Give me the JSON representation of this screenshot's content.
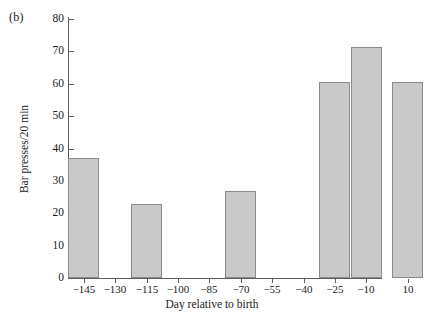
{
  "figure": {
    "panel_label": "(b)",
    "background": "#ffffff",
    "bar_fill": "#c9c9c9",
    "bar_edge": "#8a8a8a",
    "axis_color": "#5c5c5c"
  },
  "chart_data": {
    "type": "bar",
    "title": "",
    "xlabel": "Day relative to birth",
    "ylabel": "Bar presses/20 min",
    "categories": [
      "-145",
      "-115",
      "-70",
      "-25",
      "-10",
      "10"
    ],
    "values": [
      37,
      23,
      27,
      60.5,
      71.5,
      60.5
    ],
    "x": [
      -145,
      -115,
      -70,
      -25,
      -10,
      10
    ],
    "bar_width_days": 15,
    "xlim": [
      -152.5,
      -2.5
    ],
    "ylim": [
      0,
      80
    ],
    "ytick_values": [
      0,
      10,
      20,
      30,
      40,
      50,
      60,
      70,
      80
    ],
    "ytick_labels": [
      "0",
      "10",
      "20",
      "30",
      "40",
      "50",
      "60",
      "70",
      "80"
    ],
    "xtick_values": [
      -145,
      -130,
      -115,
      -100,
      -85,
      -70,
      -55,
      -40,
      -25,
      -10,
      10
    ],
    "xtick_labels": [
      "−145",
      "−130",
      "−115",
      "−100",
      "−85",
      "−70",
      "−55",
      "−40",
      "−25",
      "−10",
      "10"
    ],
    "grid": false,
    "legend": null,
    "series": [
      {
        "name": "Bar presses per 20 min",
        "values": [
          37,
          23,
          27,
          60.5,
          71.5,
          60.5
        ]
      }
    ]
  }
}
